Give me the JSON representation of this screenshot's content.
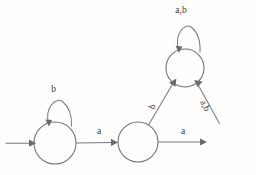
{
  "diagram": {
    "type": "state-machine",
    "alphabet": [
      "a",
      "b"
    ],
    "canvas": {
      "width": 256,
      "height": 175,
      "background": "#fefefe"
    },
    "stroke_color": "#6f6f70",
    "label_color": "#3a3a3b",
    "states": [
      {
        "id": "q0",
        "cx": 55,
        "cy": 143,
        "r": 21,
        "accepting": false,
        "start": true,
        "label": ""
      },
      {
        "id": "q1",
        "cx": 138,
        "cy": 142,
        "r": 20,
        "accepting": false,
        "start": false,
        "label": ""
      },
      {
        "id": "q2",
        "cx": 185,
        "cy": 68,
        "r": 19,
        "accepting": false,
        "start": false,
        "label": ""
      },
      {
        "id": "q3",
        "cx": 227,
        "cy": 142,
        "r": 20,
        "inner_r": 16,
        "accepting": true,
        "start": false,
        "label": ""
      }
    ],
    "transitions": [
      {
        "id": "t-start",
        "from": "",
        "to": "q0",
        "symbol": "",
        "kind": "start-arrow"
      },
      {
        "id": "t-q0-self",
        "from": "q0",
        "to": "q0",
        "symbol": "b",
        "kind": "self-loop"
      },
      {
        "id": "t-q0-q1",
        "from": "q0",
        "to": "q1",
        "symbol": "a",
        "kind": "straight"
      },
      {
        "id": "t-q1-q2",
        "from": "q1",
        "to": "q2",
        "symbol": "b",
        "kind": "diagonal"
      },
      {
        "id": "t-q1-q3",
        "from": "q1",
        "to": "q3",
        "symbol": "a",
        "kind": "straight"
      },
      {
        "id": "t-q3-q2",
        "from": "q3",
        "to": "q2",
        "symbol": "a,b",
        "kind": "diagonal"
      },
      {
        "id": "t-q2-self",
        "from": "q2",
        "to": "q2",
        "symbol": "a,b",
        "kind": "self-loop"
      }
    ],
    "labels": {
      "loop_q0": "b",
      "loop_q2": "a,b",
      "edge_q0_q1": "a",
      "edge_q1_q2": "b",
      "edge_q1_q3": "a",
      "edge_q3_q2": "a,b"
    }
  }
}
